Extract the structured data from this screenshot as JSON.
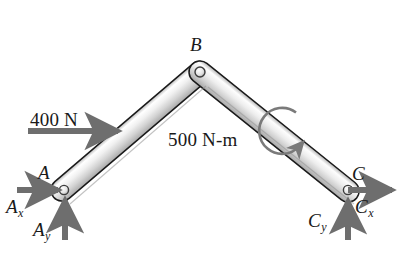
{
  "figure": {
    "background_color": "#ffffff",
    "member_fill_light": "#f2f2f2",
    "member_fill_mid": "#d9d9d9",
    "member_fill_dark": "#b5b5b5",
    "member_outline_color": "#1a1a1a",
    "arrow_color": "#6e6e6e",
    "moment_arc_color": "#7a7a7a",
    "text_color": "#191919"
  },
  "labels": {
    "applied_force": "400 N",
    "applied_moment": "500 N-m",
    "joint_a": "A",
    "joint_b": "B",
    "joint_c": "C",
    "reaction_ax": "A",
    "reaction_ax_sub": "x",
    "reaction_ay": "A",
    "reaction_ay_sub": "y",
    "reaction_cx": "C",
    "reaction_cx_sub": "x",
    "reaction_cy": "C",
    "reaction_cy_sub": "y"
  },
  "geometry": {
    "joint_a": {
      "x": 62,
      "y": 190
    },
    "joint_b": {
      "x": 200,
      "y": 72
    },
    "joint_c": {
      "x": 348,
      "y": 191
    },
    "member_ab_width": 22,
    "member_bc_width": 22,
    "pin_radius": 5
  },
  "arrows": {
    "applied_force_400n": {
      "from_x": 28,
      "from_y": 131,
      "to_x": 122,
      "to_y": 131,
      "direction": "right"
    },
    "reaction_ax": {
      "from_x": 17,
      "from_y": 190,
      "to_x": 62,
      "to_y": 190,
      "direction": "right"
    },
    "reaction_ay": {
      "from_x": 65,
      "from_y": 238,
      "to_x": 65,
      "to_y": 196,
      "direction": "up"
    },
    "reaction_cx": {
      "from_x": 348,
      "from_y": 190,
      "to_x": 396,
      "to_y": 190,
      "direction": "right"
    },
    "reaction_cy": {
      "from_x": 348,
      "from_y": 238,
      "to_x": 348,
      "to_y": 197,
      "direction": "up"
    }
  },
  "moment": {
    "center_x": 285,
    "center_y": 133,
    "radius": 23,
    "sense": "clockwise",
    "value": "500 N-m"
  }
}
